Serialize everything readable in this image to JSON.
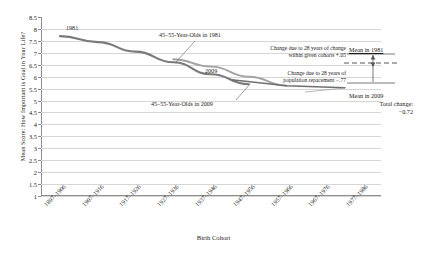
{
  "chart_data": {
    "type": "line",
    "title": "",
    "xlabel": "Birth Cohort",
    "ylabel": "Mean Score: How Important is Goal in Your Life?",
    "ylim": [
      1,
      8.5
    ],
    "yticks": [
      "1",
      "1.5",
      "2",
      "2.5",
      "3",
      "3.5",
      "4",
      "4.5",
      "5",
      "5.5",
      "6",
      "6.5",
      "7",
      "7.5",
      "8",
      "8.5"
    ],
    "categories": [
      "1897–1906",
      "1907–1916",
      "1917–1926",
      "1927–1936",
      "1937–1946",
      "1947–1956",
      "1957–1966",
      "1967–1976",
      "1977–1986"
    ],
    "grid": true,
    "legend_position": "inline-annotations",
    "series": [
      {
        "name": "1981",
        "label": "45–55-Year-Olds in 1981",
        "color": "#7a7a7a",
        "x": [
          "1897–1906",
          "1907–1916",
          "1917–1926",
          "1927–1936",
          "1937–1946",
          "1947–1956"
        ],
        "values": [
          7.7,
          7.45,
          7.05,
          6.6,
          6.1,
          5.68
        ]
      },
      {
        "name": "2009",
        "label": "45–55-Year-Olds in 2009",
        "color": "#9a9a9a",
        "x": [
          "1927–1936",
          "1937–1946",
          "1947–1956",
          "1957–1966"
        ],
        "values": [
          6.73,
          6.42,
          6.0,
          5.62
        ]
      }
    ],
    "annotations": [
      {
        "name": "series-label-1981",
        "text": "1981"
      },
      {
        "name": "series-label-2009",
        "text": "2009"
      },
      {
        "name": "cohort-label-1981",
        "text": "45–55-Year-Olds in 1981"
      },
      {
        "name": "cohort-label-2009",
        "text": "45–55-Year-Olds in 2009"
      },
      {
        "name": "within-cohort-note",
        "line1": "Change due to 28 years of change",
        "line2": "within given cohorts +.05"
      },
      {
        "name": "population-replacement-note",
        "line1": "Change due to 28 years of",
        "line2": "population repacement −.77"
      },
      {
        "name": "mean-1981-label",
        "text": "Mean in 1981"
      },
      {
        "name": "mean-2009-label",
        "text": "Mean in 2009"
      },
      {
        "name": "total-change-label",
        "line1": "Total change:",
        "line2": "−0.72"
      }
    ]
  },
  "axis": {
    "y_title": "Mean Score: How Important is Goal in Your Life?",
    "x_title": "Birth Cohort"
  },
  "labels": {
    "s1981": "1981",
    "s2009": "2009",
    "cohort1981": "45–55-Year-Olds in 1981",
    "cohort2009": "45–55-Year-Olds in 2009",
    "within1": "Change due to 28 years of change",
    "within2": "within given cohorts +.05",
    "replace1": "Change due to 28 years of",
    "replace2": "population repacement −.77",
    "mean1981": "Mean in 1981",
    "mean2009": "Mean in 2009",
    "totalchange1": "Total change:",
    "totalchange2": "−0.72"
  },
  "colors": {
    "grid": "#d6d6d6",
    "axis": "#8e8e8e",
    "series1981": "#7a7a7a",
    "series2009": "#9a9a9a",
    "text": "#1a1a1a"
  }
}
